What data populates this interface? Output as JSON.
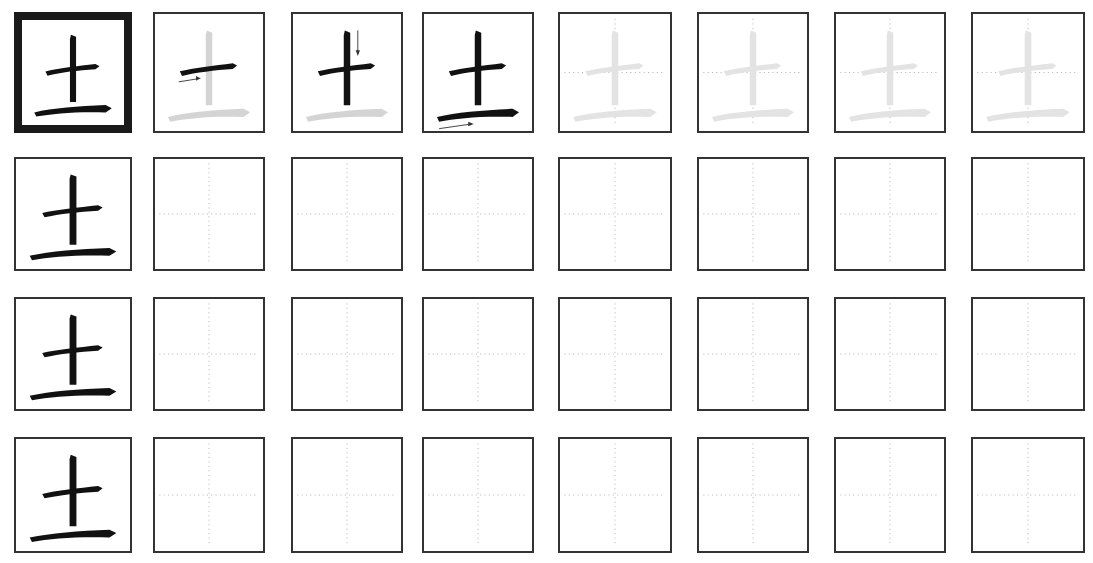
{
  "worksheet": {
    "character": "土",
    "top_text_cropped": "",
    "columns": 8,
    "rows": 4,
    "colors": {
      "stroke_active": "#111111",
      "stroke_trace": "#d4d4d4",
      "stroke_ghost": "#e3e3e3",
      "border": "#333333",
      "guide_dots": "#b0b0b0",
      "arrow": "#333333"
    },
    "row1": {
      "cells": [
        {
          "type": "model",
          "label": "full character, bold frame"
        },
        {
          "type": "stroke-step",
          "step": 1,
          "stroke": "horizontal (héng)",
          "arrow": "right"
        },
        {
          "type": "stroke-step",
          "step": 2,
          "stroke": "vertical (shù)",
          "arrow": "down"
        },
        {
          "type": "stroke-step",
          "step": 3,
          "stroke": "horizontal (héng)",
          "arrow": "right"
        },
        {
          "type": "trace"
        },
        {
          "type": "trace"
        },
        {
          "type": "trace"
        },
        {
          "type": "trace"
        }
      ]
    },
    "practice_rows": [
      {
        "model": "土",
        "blank_cells": 7
      },
      {
        "model": "土",
        "blank_cells": 7
      },
      {
        "model": "土",
        "blank_cells": 7
      }
    ]
  }
}
